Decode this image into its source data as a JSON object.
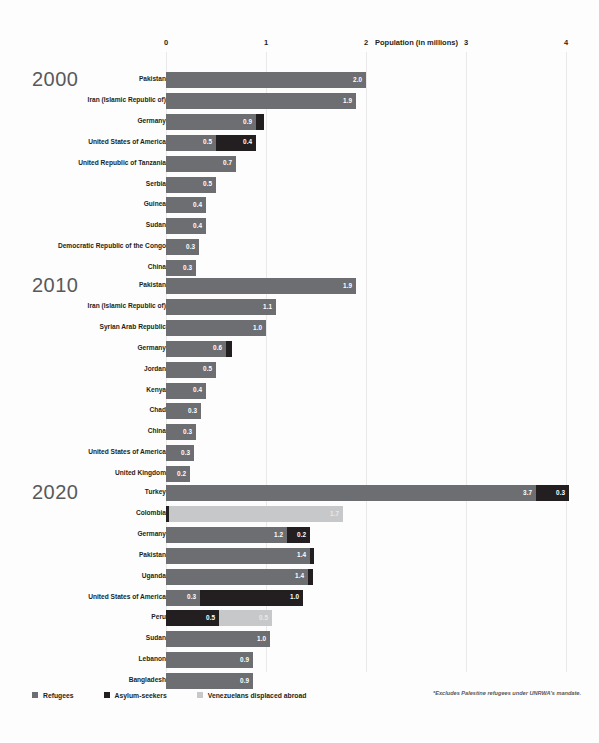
{
  "chart_data": {
    "type": "bar",
    "title": "",
    "xlabel": "Population (in millions)",
    "ylabel": "",
    "xlim": [
      0,
      4.35
    ],
    "xticks": [
      0,
      1,
      2,
      3,
      4
    ],
    "xticklabels": [
      "0",
      "1",
      "2",
      "3",
      "4"
    ],
    "grid": true,
    "orientation": "horizontal",
    "stacked": true,
    "legend_position": "bottom-left",
    "legend": [
      "Refugees",
      "Asylum-seekers",
      "Venezuelans displaced abroad"
    ],
    "series_colors": {
      "refugees": "#6d6e71",
      "asylum_seekers": "#231f20",
      "venezuelans": "#c7c8ca"
    },
    "footnote": "*Excludes Palestine refugees under UNRWA's mandate.",
    "panels": [
      {
        "year": "2000",
        "rows": [
          {
            "label": "Pakistan",
            "segments": [
              {
                "series": "refugees",
                "value": 2.0,
                "label": "2.0"
              }
            ]
          },
          {
            "label": "Iran (Islamic Republic of)",
            "segments": [
              {
                "series": "refugees",
                "value": 1.9,
                "label": "1.9"
              }
            ]
          },
          {
            "label": "Germany",
            "segments": [
              {
                "series": "refugees",
                "value": 0.9,
                "label": "0.9"
              },
              {
                "series": "asylum_seekers",
                "value": 0.08,
                "label": ""
              }
            ]
          },
          {
            "label": "United States of America",
            "segments": [
              {
                "series": "refugees",
                "value": 0.5,
                "label": "0.5"
              },
              {
                "series": "asylum_seekers",
                "value": 0.4,
                "label": "0.4"
              }
            ]
          },
          {
            "label": "United Republic of Tanzania",
            "segments": [
              {
                "series": "refugees",
                "value": 0.7,
                "label": "0.7"
              }
            ]
          },
          {
            "label": "Serbia",
            "segments": [
              {
                "series": "refugees",
                "value": 0.5,
                "label": "0.5"
              }
            ]
          },
          {
            "label": "Guinea",
            "segments": [
              {
                "series": "refugees",
                "value": 0.4,
                "label": "0.4"
              }
            ]
          },
          {
            "label": "Sudan",
            "segments": [
              {
                "series": "refugees",
                "value": 0.4,
                "label": "0.4"
              }
            ]
          },
          {
            "label": "Democratic Republic of the Congo",
            "segments": [
              {
                "series": "refugees",
                "value": 0.33,
                "label": "0.3"
              }
            ]
          },
          {
            "label": "China",
            "segments": [
              {
                "series": "refugees",
                "value": 0.3,
                "label": "0.3"
              }
            ]
          }
        ]
      },
      {
        "year": "2010",
        "rows": [
          {
            "label": "Pakistan",
            "segments": [
              {
                "series": "refugees",
                "value": 1.9,
                "label": "1.9"
              }
            ]
          },
          {
            "label": "Iran (Islamic Republic of)",
            "segments": [
              {
                "series": "refugees",
                "value": 1.1,
                "label": "1.1"
              }
            ]
          },
          {
            "label": "Syrian Arab Republic",
            "segments": [
              {
                "series": "refugees",
                "value": 1.0,
                "label": "1.0"
              }
            ]
          },
          {
            "label": "Germany",
            "segments": [
              {
                "series": "refugees",
                "value": 0.6,
                "label": "0.6"
              },
              {
                "series": "asylum_seekers",
                "value": 0.06,
                "label": ""
              }
            ]
          },
          {
            "label": "Jordan",
            "segments": [
              {
                "series": "refugees",
                "value": 0.5,
                "label": "0.5"
              }
            ]
          },
          {
            "label": "Kenya",
            "segments": [
              {
                "series": "refugees",
                "value": 0.4,
                "label": "0.4"
              }
            ]
          },
          {
            "label": "Chad",
            "segments": [
              {
                "series": "refugees",
                "value": 0.35,
                "label": "0.3"
              }
            ]
          },
          {
            "label": "China",
            "segments": [
              {
                "series": "refugees",
                "value": 0.3,
                "label": "0.3"
              }
            ]
          },
          {
            "label": "United States of America",
            "segments": [
              {
                "series": "refugees",
                "value": 0.28,
                "label": "0.3"
              }
            ]
          },
          {
            "label": "United Kingdom",
            "segments": [
              {
                "series": "refugees",
                "value": 0.24,
                "label": "0.2"
              }
            ]
          }
        ]
      },
      {
        "year": "2020",
        "rows": [
          {
            "label": "Turkey",
            "segments": [
              {
                "series": "refugees",
                "value": 3.7,
                "label": "3.7"
              },
              {
                "series": "asylum_seekers",
                "value": 0.33,
                "label": "0.3"
              }
            ]
          },
          {
            "label": "Colombia",
            "segments": [
              {
                "series": "asylum_seekers",
                "value": 0.03,
                "label": ""
              },
              {
                "series": "venezuelans",
                "value": 1.74,
                "label": "1.7"
              }
            ]
          },
          {
            "label": "Germany",
            "segments": [
              {
                "series": "refugees",
                "value": 1.21,
                "label": "1.2"
              },
              {
                "series": "asylum_seekers",
                "value": 0.23,
                "label": "0.2"
              }
            ]
          },
          {
            "label": "Pakistan",
            "segments": [
              {
                "series": "refugees",
                "value": 1.44,
                "label": "1.4"
              },
              {
                "series": "asylum_seekers",
                "value": 0.04,
                "label": ""
              }
            ]
          },
          {
            "label": "Uganda",
            "segments": [
              {
                "series": "refugees",
                "value": 1.42,
                "label": "1.4"
              },
              {
                "series": "asylum_seekers",
                "value": 0.05,
                "label": ""
              }
            ]
          },
          {
            "label": "United States of America",
            "segments": [
              {
                "series": "refugees",
                "value": 0.34,
                "label": "0.3"
              },
              {
                "series": "asylum_seekers",
                "value": 1.03,
                "label": "1.0"
              }
            ]
          },
          {
            "label": "Peru",
            "segments": [
              {
                "series": "asylum_seekers",
                "value": 0.53,
                "label": "0.5"
              },
              {
                "series": "venezuelans",
                "value": 0.53,
                "label": "0.5"
              }
            ]
          },
          {
            "label": "Sudan",
            "segments": [
              {
                "series": "refugees",
                "value": 1.04,
                "label": "1.0"
              }
            ]
          },
          {
            "label": "Lebanon",
            "segments": [
              {
                "series": "refugees",
                "value": 0.87,
                "label": "0.9"
              }
            ]
          },
          {
            "label": "Bangladesh",
            "segments": [
              {
                "series": "refugees",
                "value": 0.87,
                "label": "0.9"
              }
            ]
          }
        ]
      }
    ]
  }
}
